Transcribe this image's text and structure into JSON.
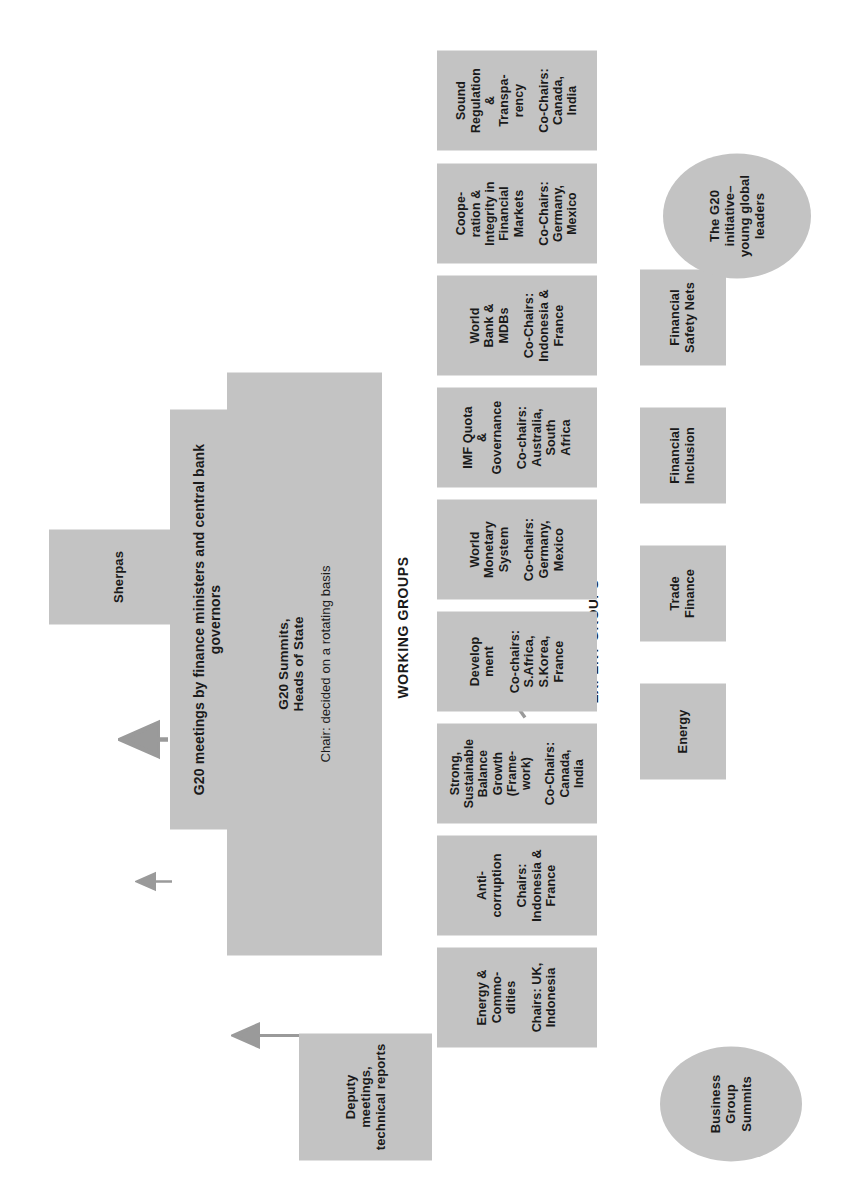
{
  "diagram": {
    "box_fill": "#c3c3c3",
    "connector_color": "#9a9a9a",
    "section_labels": {
      "working_groups": "WORKING GROUPS",
      "expert_groups": "EXPERT GROUPS"
    },
    "top_nodes": {
      "sherpas": {
        "title": "Sherpas"
      },
      "summits": {
        "title_line1": "G20 Summits,",
        "title_line2": "Heads of State",
        "note": "Chair: decided on a rotating basis"
      },
      "deputies": {
        "line1": "Deputy",
        "line2": "meetings,",
        "line3": "technical reports"
      },
      "ministers": {
        "line1": "G20 meetings by finance ministers and central bank",
        "line2": "governors"
      }
    },
    "working_groups": [
      {
        "name": "sound-regulation",
        "title": [
          "Sound",
          "Regulation",
          "&",
          "Transpa-",
          "rency"
        ],
        "chairs": [
          "Co-Chairs:",
          "Canada,",
          "India"
        ]
      },
      {
        "name": "cooperation-integrity",
        "title": [
          "Coope-",
          "ration &",
          "Integrity in",
          "Financial",
          "Markets"
        ],
        "chairs": [
          "Co-Chairs:",
          "Germany,",
          "Mexico"
        ]
      },
      {
        "name": "world-bank-mdbs",
        "title": [
          "World",
          "Bank &",
          "MDBs"
        ],
        "chairs": [
          "Co-Chairs:",
          "Indonesia &",
          "France"
        ]
      },
      {
        "name": "imf-quota-governance",
        "title": [
          "IMF Quota",
          "&",
          "Governance"
        ],
        "chairs": [
          "Co-chairs:",
          "Australia,",
          "South",
          "Africa"
        ]
      },
      {
        "name": "world-monetary-system",
        "title": [
          "World",
          "Monetary",
          "System"
        ],
        "chairs": [
          "Co-chairs:",
          "Germany,",
          "Mexico"
        ]
      },
      {
        "name": "development",
        "title": [
          "Develop",
          "ment"
        ],
        "chairs": [
          "Co-chairs:",
          "S.Africa,",
          "S.Korea,",
          "France"
        ]
      },
      {
        "name": "framework",
        "title": [
          "Strong,",
          "Sustainable",
          "Balance",
          "Growth",
          "(Frame-",
          "work)"
        ],
        "chairs": [
          "Co-Chairs:",
          "Canada,",
          "India"
        ]
      },
      {
        "name": "anti-corruption",
        "title": [
          "Anti-",
          "corruption"
        ],
        "chairs": [
          "Chairs:",
          "Indonesia &",
          "France"
        ]
      },
      {
        "name": "energy-commodities",
        "title": [
          "Energy &",
          "Commo-",
          "dities"
        ],
        "chairs": [
          "Chairs: UK,",
          "Indonesia"
        ]
      }
    ],
    "expert_groups": [
      {
        "name": "financial-safety-nets",
        "title": [
          "Financial",
          "Safety Nets"
        ]
      },
      {
        "name": "financial-inclusion",
        "title": [
          "Financial",
          "Inclusion"
        ]
      },
      {
        "name": "trade-finance",
        "title": [
          "Trade",
          "Finance"
        ]
      },
      {
        "name": "energy",
        "title": [
          "Energy"
        ]
      }
    ],
    "ellipses": [
      {
        "name": "business-group-summits",
        "title": [
          "Business",
          "Group",
          "Summits"
        ]
      },
      {
        "name": "g20-young-global-leaders",
        "title": [
          "The G20",
          "initiative–",
          "young global",
          "leaders"
        ]
      }
    ]
  }
}
